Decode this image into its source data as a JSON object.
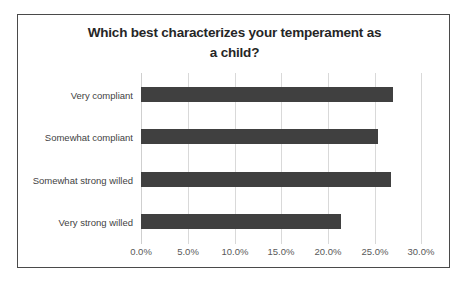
{
  "chart_data": {
    "type": "bar",
    "orientation": "horizontal",
    "title": "Which best characterizes your temperament as a child?",
    "title_line1": "Which best characterizes your temperament as",
    "title_line2": "a child?",
    "categories": [
      "Very compliant",
      "Somewhat compliant",
      "Somewhat strong willed",
      "Very strong willed"
    ],
    "values": [
      26.9,
      25.3,
      26.7,
      21.3
    ],
    "value_labels": [
      "26.9%",
      "25.3%",
      "26.7%",
      "21.3%"
    ],
    "xlabel": "",
    "ylabel": "",
    "xlim": [
      0,
      30
    ],
    "xticks": [
      0,
      5,
      10,
      15,
      20,
      25,
      30
    ],
    "xtick_labels": [
      "0.0%",
      "5.0%",
      "10.0%",
      "15.0%",
      "20.0%",
      "25.0%",
      "30.0%"
    ],
    "grid": true,
    "grid_axis": "x",
    "legend": false,
    "bar_color": "#404040",
    "gridline_color": "#d9d9d9",
    "border_color": "#4a4a4a",
    "background_color": "#ffffff",
    "title_color": "#262626",
    "label_color": "#3f3f3f"
  }
}
